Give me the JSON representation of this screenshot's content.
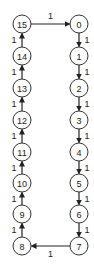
{
  "diagram": {
    "type": "ring-graph",
    "nodes": [
      {
        "id": "0",
        "label": "0",
        "x": 79,
        "y": 24
      },
      {
        "id": "1",
        "label": "1",
        "x": 79,
        "y": 56
      },
      {
        "id": "2",
        "label": "2",
        "x": 79,
        "y": 88
      },
      {
        "id": "3",
        "label": "3",
        "x": 79,
        "y": 120
      },
      {
        "id": "4",
        "label": "4",
        "x": 79,
        "y": 152
      },
      {
        "id": "5",
        "label": "5",
        "x": 79,
        "y": 183
      },
      {
        "id": "6",
        "label": "6",
        "x": 79,
        "y": 214
      },
      {
        "id": "7",
        "label": "7",
        "x": 79,
        "y": 246
      },
      {
        "id": "8",
        "label": "8",
        "x": 22,
        "y": 246
      },
      {
        "id": "9",
        "label": "9",
        "x": 22,
        "y": 214
      },
      {
        "id": "10",
        "label": "10",
        "x": 22,
        "y": 183
      },
      {
        "id": "11",
        "label": "11",
        "x": 22,
        "y": 152
      },
      {
        "id": "12",
        "label": "12",
        "x": 22,
        "y": 120
      },
      {
        "id": "13",
        "label": "13",
        "x": 22,
        "y": 88
      },
      {
        "id": "14",
        "label": "14",
        "x": 22,
        "y": 56
      },
      {
        "id": "15",
        "label": "15",
        "x": 22,
        "y": 24
      }
    ],
    "edges": [
      {
        "from": "15",
        "to": "0",
        "weight": "1",
        "label_pos": "above"
      },
      {
        "from": "0",
        "to": "1",
        "weight": "1",
        "label_pos": "right"
      },
      {
        "from": "1",
        "to": "2",
        "weight": "1",
        "label_pos": "right"
      },
      {
        "from": "2",
        "to": "3",
        "weight": "1",
        "label_pos": "right"
      },
      {
        "from": "3",
        "to": "4",
        "weight": "1",
        "label_pos": "right"
      },
      {
        "from": "4",
        "to": "5",
        "weight": "1",
        "label_pos": "right"
      },
      {
        "from": "5",
        "to": "6",
        "weight": "1",
        "label_pos": "right"
      },
      {
        "from": "6",
        "to": "7",
        "weight": "1",
        "label_pos": "right"
      },
      {
        "from": "7",
        "to": "8",
        "weight": "1",
        "label_pos": "below"
      },
      {
        "from": "8",
        "to": "9",
        "weight": "1",
        "label_pos": "left"
      },
      {
        "from": "9",
        "to": "10",
        "weight": "1",
        "label_pos": "left"
      },
      {
        "from": "10",
        "to": "11",
        "weight": "1",
        "label_pos": "left"
      },
      {
        "from": "11",
        "to": "12",
        "weight": "1",
        "label_pos": "left"
      },
      {
        "from": "12",
        "to": "13",
        "weight": "1",
        "label_pos": "left"
      },
      {
        "from": "13",
        "to": "14",
        "weight": "1",
        "label_pos": "left"
      },
      {
        "from": "14",
        "to": "15",
        "weight": "1",
        "label_pos": "left"
      }
    ],
    "node_radius": 9,
    "colors": {
      "stroke": "#333333",
      "text": "#222222",
      "background": "#ffffff"
    }
  }
}
